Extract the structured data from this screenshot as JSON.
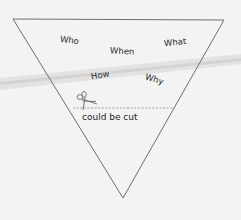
{
  "diagram": {
    "type": "inverted-pyramid",
    "colors": {
      "background": "#f3f3f3",
      "stroke": "#707070",
      "band": "#d9d9d9",
      "text": "#2a2a2a"
    },
    "triangle": {
      "top_left": [
        13,
        19
      ],
      "top_right": [
        224,
        20
      ],
      "apex": [
        123,
        198
      ]
    },
    "words": [
      {
        "label": "Who",
        "x": 60,
        "y": 36,
        "rotate": 8
      },
      {
        "label": "When",
        "x": 110,
        "y": 47,
        "rotate": 3
      },
      {
        "label": "What",
        "x": 164,
        "y": 38,
        "rotate": -6
      },
      {
        "label": "How",
        "x": 91,
        "y": 71,
        "rotate": -10
      },
      {
        "label": "Why",
        "x": 145,
        "y": 75,
        "rotate": 18
      }
    ],
    "cut_line": {
      "y": 108,
      "x_start": 73,
      "x_end": 175,
      "icon": "scissors-icon"
    },
    "cut_label": "could be cut"
  }
}
